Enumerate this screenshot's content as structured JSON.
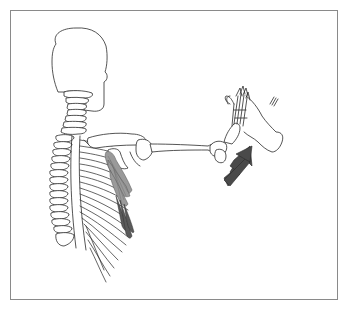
{
  "figure": {
    "type": "anatomical-illustration",
    "view": "posterior view of skull, cervical/thoracic spine, rib cage and right arm extended forward",
    "highlighted_structure": "serratus anterior muscle (shaded)",
    "force_arrow": {
      "direction": "up-right, toward palm",
      "color": "#4a4a4a"
    },
    "examiner_hand": "outlined hand pushing against patient's palm",
    "frame_border_color": "#8a8a8a",
    "muscle_colors": {
      "light": "#9a9a9a",
      "dark": "#5a5a5a"
    },
    "text_labels": []
  }
}
